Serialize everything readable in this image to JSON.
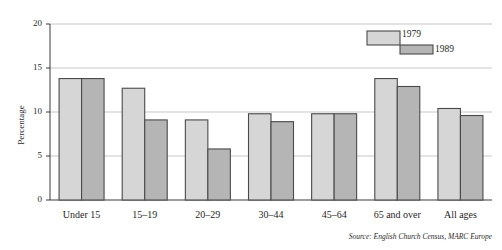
{
  "chart_data": {
    "type": "bar",
    "title": "",
    "subtitle": "",
    "xlabel": "",
    "ylabel": "Percentage",
    "ylim": [
      0,
      20
    ],
    "yticks": [
      0,
      5,
      10,
      15,
      20
    ],
    "ytick_labels": [
      "0",
      "5",
      "10",
      "15",
      "20"
    ],
    "grid": true,
    "grid_axis": "y",
    "legend_position": "top-right-inside",
    "categories": [
      "Under 15",
      "15–19",
      "20–29",
      "30–44",
      "45–64",
      "65 and over",
      "All ages"
    ],
    "series": [
      {
        "name": "1979",
        "color": "#d6d6d6",
        "edge_color": "#4a4a4a",
        "values": [
          13.8,
          12.7,
          9.1,
          9.8,
          9.8,
          13.8,
          10.4
        ]
      },
      {
        "name": "1989",
        "color": "#b5b5b5",
        "edge_color": "#4a4a4a",
        "values": [
          13.8,
          9.1,
          5.8,
          8.9,
          9.8,
          12.9,
          9.6
        ]
      }
    ],
    "annotations": [
      "Source: English Church Census, MARC Europe"
    ]
  },
  "source": {
    "prefix": "Source:",
    "text": "English Church Census, MARC Europe",
    "full": "Source: English Church Census, MARC Europe"
  },
  "legend": {
    "entries": [
      {
        "label": "1979",
        "color": "#d6d6d6"
      },
      {
        "label": "1989",
        "color": "#b5b5b5"
      }
    ]
  },
  "axes": {
    "y_title": "Percentage",
    "y_ticks": [
      "0",
      "5",
      "10",
      "15",
      "20"
    ],
    "x_ticks": [
      "Under 15",
      "15–19",
      "20–29",
      "30–44",
      "45–64",
      "65 and over",
      "All ages"
    ]
  },
  "colors": {
    "series_1979": "#d6d6d6",
    "series_1989": "#b5b5b5",
    "bar_edge": "#4a4a4a",
    "gridline": "#b9b9b9",
    "axis": "#3a3a3a",
    "background": "#ffffff"
  }
}
